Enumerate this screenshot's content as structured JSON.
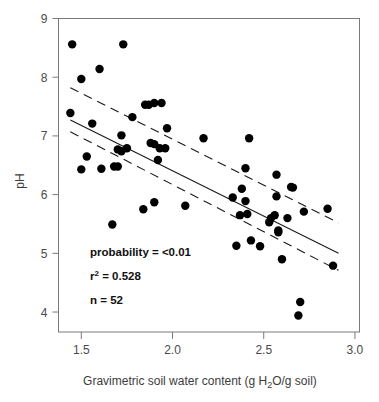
{
  "chart_data": {
    "type": "scatter",
    "title": "",
    "xlabel": "Gravimetric soil water content (g H2O/g soil)",
    "xlabel_parts": {
      "before": "Gravimetric soil water content (g H",
      "sub": "2",
      "after": "O/g soil)"
    },
    "ylabel": "pH",
    "xlim": [
      1.375,
      3.025
    ],
    "ylim": [
      3.66,
      9.0
    ],
    "grid": false,
    "legend": null,
    "xticks": [
      1.5,
      2.0,
      2.5,
      3.0
    ],
    "xticklabels": [
      "1.5",
      "2.0",
      "2.5",
      "3.0"
    ],
    "yticks": [
      4,
      5,
      6,
      7,
      8,
      9
    ],
    "yticklabels": [
      "4",
      "5",
      "6",
      "7",
      "8",
      "9"
    ],
    "series": [
      {
        "name": "soil samples",
        "marker": "filled-circle",
        "color": "#000000",
        "n": 52,
        "points": [
          [
            1.45,
            8.56
          ],
          [
            1.73,
            8.56
          ],
          [
            1.6,
            8.14
          ],
          [
            1.5,
            7.97
          ],
          [
            1.44,
            7.39
          ],
          [
            1.56,
            7.21
          ],
          [
            1.78,
            7.32
          ],
          [
            1.85,
            7.53
          ],
          [
            1.87,
            7.53
          ],
          [
            1.9,
            7.56
          ],
          [
            1.94,
            7.56
          ],
          [
            1.72,
            7.01
          ],
          [
            1.97,
            7.13
          ],
          [
            2.17,
            6.96
          ],
          [
            2.42,
            6.96
          ],
          [
            1.53,
            6.65
          ],
          [
            1.7,
            6.77
          ],
          [
            1.72,
            6.74
          ],
          [
            1.75,
            6.79
          ],
          [
            1.88,
            6.88
          ],
          [
            1.9,
            6.86
          ],
          [
            1.93,
            6.79
          ],
          [
            1.96,
            6.79
          ],
          [
            1.5,
            6.43
          ],
          [
            1.61,
            6.44
          ],
          [
            1.68,
            6.48
          ],
          [
            1.7,
            6.48
          ],
          [
            1.92,
            6.59
          ],
          [
            2.4,
            6.45
          ],
          [
            2.57,
            6.34
          ],
          [
            2.65,
            6.13
          ],
          [
            2.66,
            6.12
          ],
          [
            2.38,
            6.1
          ],
          [
            2.57,
            5.97
          ],
          [
            2.33,
            5.95
          ],
          [
            2.4,
            5.89
          ],
          [
            1.84,
            5.75
          ],
          [
            1.9,
            5.87
          ],
          [
            2.07,
            5.81
          ],
          [
            2.56,
            5.65
          ],
          [
            2.37,
            5.65
          ],
          [
            2.41,
            5.67
          ],
          [
            2.54,
            5.6
          ],
          [
            2.63,
            5.6
          ],
          [
            2.72,
            5.71
          ],
          [
            2.85,
            5.76
          ],
          [
            2.53,
            5.53
          ],
          [
            2.58,
            5.39
          ],
          [
            2.58,
            5.36
          ],
          [
            2.35,
            5.13
          ],
          [
            2.43,
            5.22
          ],
          [
            2.48,
            5.12
          ],
          [
            2.6,
            4.9
          ],
          [
            2.88,
            4.79
          ],
          [
            1.67,
            5.49
          ],
          [
            2.7,
            4.17
          ],
          [
            2.69,
            3.94
          ]
        ]
      }
    ],
    "fit": {
      "name": "regression-line",
      "style": "solid",
      "x0": 1.44,
      "y0": 7.27,
      "x1": 2.91,
      "y1": 5.0
    },
    "confidence_bands": [
      {
        "name": "upper-confidence-band",
        "style": "dashed",
        "x0": 1.44,
        "y0": 7.82,
        "x1": 2.91,
        "y1": 5.52
      },
      {
        "name": "lower-confidence-band",
        "style": "dashed",
        "x0": 1.44,
        "y0": 7.07,
        "x1": 2.91,
        "y1": 4.71
      }
    ],
    "annotations": [
      {
        "name": "probability",
        "text": "probability = <0.01"
      },
      {
        "name": "r-squared",
        "text": "r2 = 0.528",
        "base": "r",
        "sup": "2",
        "rest": " = 0.528"
      },
      {
        "name": "sample-size",
        "text": "n = 52"
      }
    ]
  },
  "colors": {
    "marker": "#000000",
    "axis": "#7a7a7a",
    "text": "#3c3c3c",
    "annotation": "#111111",
    "background": "#ffffff"
  }
}
